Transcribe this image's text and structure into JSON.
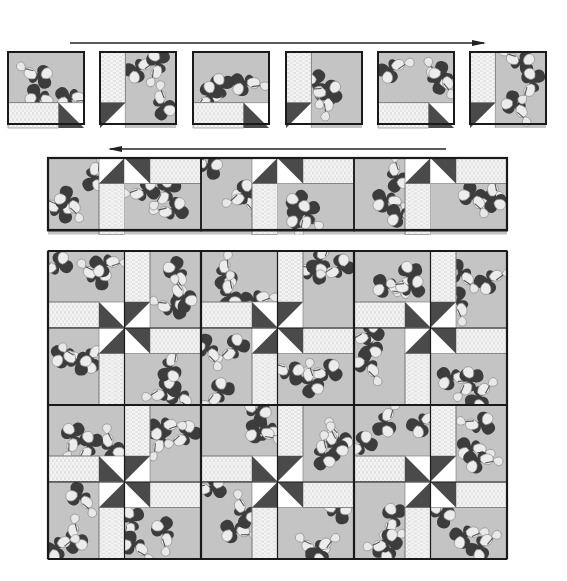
{
  "diagram": {
    "colors": {
      "background": "#ffffff",
      "floral": "#c4c4c4",
      "floral_dark": "#3c3c3c",
      "floral_light": "#ececec",
      "stripe": "#f4f4f4",
      "stripe_line": "#cfcfcf",
      "triangle_dark": "#4a4a4a",
      "triangle_light": "#ffffff",
      "border": "#1a1a1a",
      "arrow": "#222222"
    },
    "step1": {
      "label": "Row of six units laid out left to right",
      "arrow_direction": "right",
      "units": [
        {
          "index": 1,
          "strip": "bottom",
          "triangle": "bottom-right"
        },
        {
          "index": 2,
          "strip": "left",
          "triangle": "bottom-left"
        },
        {
          "index": 3,
          "strip": "bottom",
          "triangle": "bottom-right"
        },
        {
          "index": 4,
          "strip": "left",
          "triangle": "bottom-left"
        },
        {
          "index": 5,
          "strip": "bottom",
          "triangle": "bottom-right"
        },
        {
          "index": 6,
          "strip": "left",
          "triangle": "bottom-left"
        }
      ]
    },
    "step2": {
      "label": "Units joined into a row, turned to form pinwheel halves",
      "arrow_direction": "left",
      "unit_count": 6
    },
    "step3": {
      "label": "Completed quilt top",
      "blocks_across": 3,
      "blocks_down": 2,
      "units_across": 6,
      "units_down": 4,
      "pinwheel_count": 6
    }
  }
}
